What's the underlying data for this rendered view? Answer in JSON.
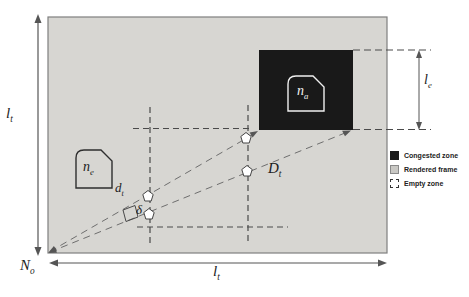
{
  "figure": {
    "type": "network-rendering-zones-diagram",
    "labels": {
      "frame_side_left": {
        "main": "l",
        "sub": "t"
      },
      "frame_side_bottom": {
        "main": "l",
        "sub": "t"
      },
      "origin_node": {
        "main": "N",
        "sub": "o"
      },
      "empty_zone_node": {
        "main": "n",
        "sub": "e"
      },
      "congested_node": {
        "main": "n",
        "sub": "a"
      },
      "near_distance": {
        "main": "d",
        "sub": "t"
      },
      "far_distance": {
        "main": "D",
        "sub": "t"
      },
      "congested_side": {
        "main": "l",
        "sub": "e"
      },
      "angle": "δ"
    },
    "legend": {
      "items": [
        {
          "label": "Congested zone",
          "swatch": "congested",
          "color": "#1a1a1a"
        },
        {
          "label": "Rendered frame",
          "swatch": "rendered",
          "color": "#c9c8c4"
        },
        {
          "label": "Empty zone",
          "swatch": "empty",
          "color": "#ffffff"
        }
      ]
    },
    "colors": {
      "rendered_frame_fill": "#d7d6d2",
      "congested_zone_fill": "#191919",
      "line_color": "#4a4a4a",
      "ray_color": "#6e6e6e",
      "background": "#ffffff"
    }
  }
}
